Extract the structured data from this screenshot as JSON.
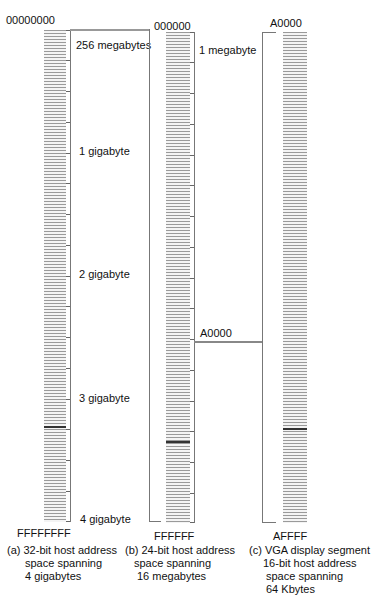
{
  "diagram": {
    "columns": [
      {
        "id": "a",
        "top_address": "00000000",
        "bottom_address": "FFFFFFFF",
        "caption_lines": [
          "(a) 32-bit host address",
          "space spanning",
          "4 gigabytes"
        ],
        "scale_labels": [
          "256 megabytes",
          "1 gigabyte",
          "2 gigabyte",
          "3 gigabyte",
          "4 gigabyte"
        ]
      },
      {
        "id": "b",
        "top_address": "000000",
        "bottom_address": "FFFFFF",
        "mid_address": "A0000",
        "caption_lines": [
          "(b) 24-bit host address",
          "space spanning",
          "16 megabytes"
        ],
        "scale_labels": [
          "1 megabyte"
        ]
      },
      {
        "id": "c",
        "top_address": "A0000",
        "bottom_address": "AFFFF",
        "caption_lines": [
          "(c) VGA display segment",
          "16-bit host address",
          "space spanning",
          "64 Kbytes"
        ]
      }
    ]
  }
}
